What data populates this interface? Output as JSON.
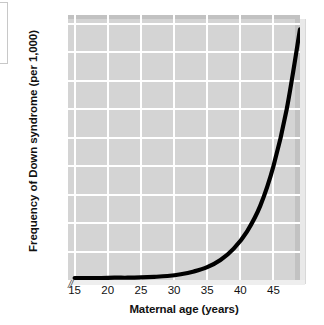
{
  "chart_data": {
    "type": "line",
    "title": "",
    "xlabel": "Maternal age (years)",
    "ylabel": "Frequency of Down syndrome (per 1,000)",
    "xlim": [
      14,
      49
    ],
    "ylim": [
      0,
      93
    ],
    "xticks": [
      15,
      20,
      25,
      30,
      35,
      40,
      45
    ],
    "yticks": [
      10,
      20,
      30,
      40,
      50,
      60,
      70,
      80,
      90
    ],
    "grid": true,
    "legend": "none",
    "axis_break": "//",
    "plot_background": "#d4d4d4",
    "gridline_color": "#ffffff",
    "line_color": "#000000",
    "series": [
      {
        "name": "Frequency of Down syndrome",
        "x": [
          15,
          17,
          19,
          21,
          23,
          25,
          27,
          29,
          31,
          33,
          35,
          37,
          39,
          41,
          43,
          45,
          47,
          49
        ],
        "values": [
          0.7,
          0.7,
          0.7,
          0.8,
          0.8,
          0.9,
          1.1,
          1.4,
          2.0,
          3.0,
          4.5,
          7.0,
          11.0,
          17.0,
          26.0,
          40.0,
          60.0,
          88.0
        ]
      }
    ]
  },
  "axes": {
    "x_tick_labels": [
      "15",
      "20",
      "25",
      "30",
      "35",
      "40",
      "45"
    ],
    "y_tick_labels": [
      "10",
      "20",
      "30",
      "40",
      "50",
      "60",
      "70",
      "80",
      "90"
    ],
    "x_title": "Maternal age (years)",
    "y_title": "Frequency of Down syndrome (per 1,000)",
    "break_symbol": "//"
  }
}
